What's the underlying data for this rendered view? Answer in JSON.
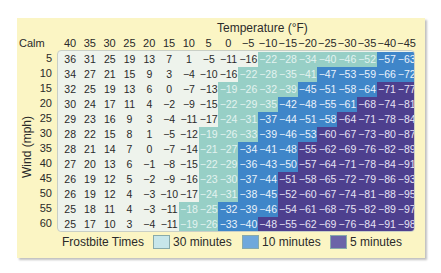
{
  "chart_data": {
    "type": "table",
    "title": "Temperature (°F)",
    "xlabel": "Temperature (°F)",
    "ylabel": "Wind (mph)",
    "corner_label": "Calm",
    "columns": [
      "40",
      "35",
      "30",
      "25",
      "20",
      "15",
      "10",
      "5",
      "0",
      "−5",
      "−10",
      "−15",
      "−20",
      "−25",
      "−30",
      "−35",
      "−40",
      "−45"
    ],
    "rows": [
      {
        "wind": "5",
        "values": [
          36,
          31,
          25,
          19,
          13,
          7,
          1,
          -5,
          -11,
          -16,
          -22,
          -28,
          -34,
          -40,
          -46,
          -52,
          -57,
          -63
        ],
        "zones": [
          0,
          0,
          0,
          0,
          0,
          0,
          0,
          0,
          0,
          0,
          1,
          1,
          1,
          1,
          1,
          1,
          2,
          2
        ]
      },
      {
        "wind": "10",
        "values": [
          34,
          27,
          21,
          15,
          9,
          3,
          -4,
          -10,
          -16,
          -22,
          -28,
          -35,
          -41,
          -47,
          -53,
          -59,
          -66,
          -72
        ],
        "zones": [
          0,
          0,
          0,
          0,
          0,
          0,
          0,
          0,
          0,
          1,
          1,
          1,
          1,
          2,
          2,
          2,
          2,
          2
        ]
      },
      {
        "wind": "15",
        "values": [
          32,
          25,
          19,
          13,
          6,
          0,
          -7,
          -13,
          -19,
          -26,
          -32,
          -39,
          -45,
          -51,
          -58,
          -64,
          -71,
          -77
        ],
        "zones": [
          0,
          0,
          0,
          0,
          0,
          0,
          0,
          0,
          1,
          1,
          1,
          1,
          2,
          2,
          2,
          2,
          3,
          3
        ]
      },
      {
        "wind": "20",
        "values": [
          30,
          24,
          17,
          11,
          4,
          -2,
          -9,
          -15,
          -22,
          -29,
          -35,
          -42,
          -48,
          -55,
          -61,
          -68,
          -74,
          -81
        ],
        "zones": [
          0,
          0,
          0,
          0,
          0,
          0,
          0,
          0,
          1,
          1,
          1,
          2,
          2,
          2,
          2,
          3,
          3,
          3
        ]
      },
      {
        "wind": "25",
        "values": [
          29,
          23,
          16,
          9,
          3,
          -4,
          -11,
          -17,
          -24,
          -31,
          -37,
          -44,
          -51,
          -58,
          -64,
          -71,
          -78,
          -84
        ],
        "zones": [
          0,
          0,
          0,
          0,
          0,
          0,
          0,
          0,
          1,
          1,
          2,
          2,
          2,
          2,
          3,
          3,
          3,
          3
        ]
      },
      {
        "wind": "30",
        "values": [
          28,
          22,
          15,
          8,
          1,
          -5,
          -12,
          -19,
          -26,
          -33,
          -39,
          -46,
          -53,
          -60,
          -67,
          -73,
          -80,
          -87
        ],
        "zones": [
          0,
          0,
          0,
          0,
          0,
          0,
          0,
          1,
          1,
          1,
          2,
          2,
          2,
          3,
          3,
          3,
          3,
          3
        ]
      },
      {
        "wind": "35",
        "values": [
          28,
          21,
          14,
          7,
          0,
          -7,
          -14,
          -21,
          -27,
          -34,
          -41,
          -48,
          -55,
          -62,
          -69,
          -76,
          -82,
          -89
        ],
        "zones": [
          0,
          0,
          0,
          0,
          0,
          0,
          0,
          1,
          1,
          2,
          2,
          2,
          3,
          3,
          3,
          3,
          3,
          3
        ]
      },
      {
        "wind": "40",
        "values": [
          27,
          20,
          13,
          6,
          -1,
          -8,
          -15,
          -22,
          -29,
          -36,
          -43,
          -50,
          -57,
          -64,
          -71,
          -78,
          -84,
          -91
        ],
        "zones": [
          0,
          0,
          0,
          0,
          0,
          0,
          0,
          1,
          1,
          2,
          2,
          2,
          3,
          3,
          3,
          3,
          3,
          3
        ]
      },
      {
        "wind": "45",
        "values": [
          26,
          19,
          12,
          5,
          -2,
          -9,
          -16,
          -23,
          -30,
          -37,
          -44,
          -51,
          -58,
          -65,
          -72,
          -79,
          -86,
          -93
        ],
        "zones": [
          0,
          0,
          0,
          0,
          0,
          0,
          0,
          1,
          1,
          2,
          2,
          3,
          3,
          3,
          3,
          3,
          3,
          3
        ]
      },
      {
        "wind": "50",
        "values": [
          26,
          19,
          12,
          4,
          -3,
          -10,
          -17,
          -24,
          -31,
          -38,
          -45,
          -52,
          -60,
          -67,
          -74,
          -81,
          -88,
          -95
        ],
        "zones": [
          0,
          0,
          0,
          0,
          0,
          0,
          0,
          1,
          1,
          2,
          2,
          3,
          3,
          3,
          3,
          3,
          3,
          3
        ]
      },
      {
        "wind": "55",
        "values": [
          25,
          18,
          11,
          4,
          -3,
          -11,
          -18,
          -25,
          -32,
          -39,
          -46,
          -54,
          -61,
          -68,
          -75,
          -82,
          -89,
          -97
        ],
        "zones": [
          0,
          0,
          0,
          0,
          0,
          0,
          1,
          1,
          2,
          2,
          2,
          3,
          3,
          3,
          3,
          3,
          3,
          3
        ]
      },
      {
        "wind": "60",
        "values": [
          25,
          17,
          10,
          3,
          -4,
          -11,
          -19,
          -26,
          -33,
          -40,
          -48,
          -55,
          -62,
          -69,
          -76,
          -84,
          -91,
          -98
        ],
        "zones": [
          0,
          0,
          0,
          0,
          0,
          0,
          1,
          1,
          2,
          2,
          3,
          3,
          3,
          3,
          3,
          3,
          3,
          3
        ]
      }
    ],
    "legend": {
      "title": "Frostbite Times",
      "entries": [
        {
          "label": "30 minutes",
          "color": "#97cfc6"
        },
        {
          "label": "10 minutes",
          "color": "#3f86c9"
        },
        {
          "label": "5 minutes",
          "color": "#4d3f8e"
        }
      ]
    },
    "colors": {
      "panel": "#fbf5c4",
      "no_risk": "#eef3ec"
    }
  },
  "labels": {
    "title": "Temperature (°F)",
    "ylabel": "Wind (mph)",
    "calm": "Calm",
    "legend_title": "Frostbite Times",
    "legend_30": "30 minutes",
    "legend_10": "10 minutes",
    "legend_5": "5 minutes"
  }
}
